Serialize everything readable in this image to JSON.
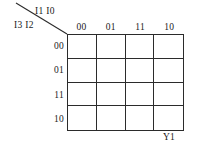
{
  "figure": {
    "type": "karnaugh-map",
    "column_variables_label": "I1 I0",
    "row_variables_label": "I3 I2",
    "output_label": "Y1",
    "column_headers": [
      "00",
      "01",
      "11",
      "10"
    ],
    "row_headers": [
      "00",
      "01",
      "11",
      "10"
    ],
    "cells": [
      [
        "",
        "",
        "",
        ""
      ],
      [
        "",
        "",
        "",
        ""
      ],
      [
        "",
        "",
        "",
        ""
      ],
      [
        "",
        "",
        "",
        ""
      ]
    ],
    "colors": {
      "background": "#ffffff",
      "line": "#2b2b2b",
      "text": "#1a1a1a"
    }
  }
}
